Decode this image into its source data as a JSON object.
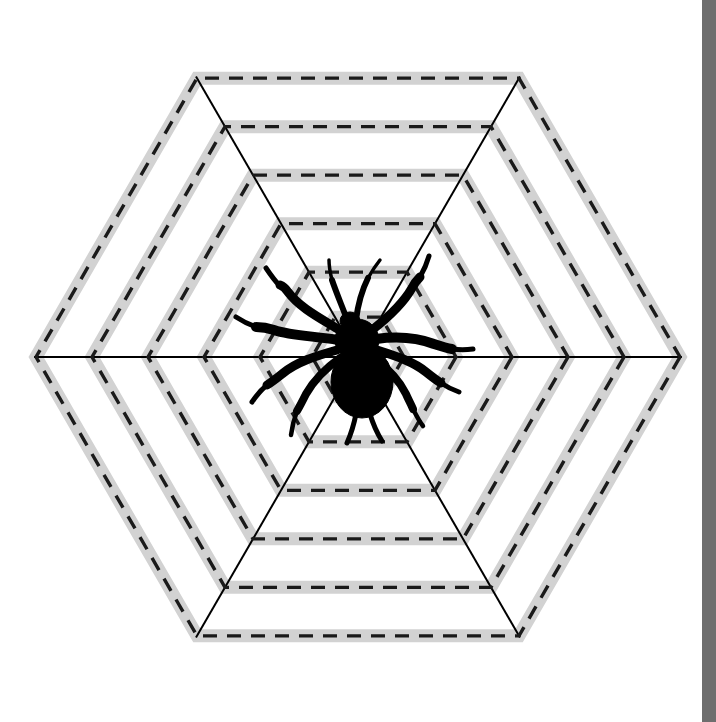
{
  "page": {
    "background_color": "#ffffff",
    "width": 716,
    "height": 722
  },
  "scrollbar": {
    "name": "vertical-scrollbar",
    "track_color": "#6e6e6e",
    "thumb_color": "#6e6e6e",
    "x": 702,
    "width": 14
  },
  "chart_data": {
    "type": "diagram",
    "subtitle": "",
    "xlabel": "",
    "ylabel": "",
    "center": {
      "x": 358,
      "y": 357
    },
    "orientation": "pointy-left-right",
    "grid": true,
    "legend": "none",
    "annotations": [],
    "band": {
      "fill_color": "#d2d2d2",
      "band_width": 13,
      "dash_color": "#1a1a1a",
      "dash_width": 3.4,
      "dash_pattern": "14 10"
    },
    "spokes": {
      "count": 3,
      "angles_deg": [
        0,
        60,
        120
      ],
      "color": "#000000",
      "width": 2,
      "length": 324,
      "horizontal_extent": {
        "x1": 34,
        "x2": 682,
        "y": 357
      }
    },
    "rings": [
      {
        "index": 1,
        "label": "ring-1-outer",
        "radius": 322
      },
      {
        "index": 2,
        "label": "ring-2",
        "radius": 266
      },
      {
        "index": 3,
        "label": "ring-3",
        "radius": 210
      },
      {
        "index": 4,
        "label": "ring-4",
        "radius": 154
      },
      {
        "index": 5,
        "label": "ring-5",
        "radius": 98
      },
      {
        "index": 6,
        "label": "ring-6-inner",
        "radius": 46
      }
    ],
    "spider": {
      "label": "spider-silhouette",
      "color": "#000000",
      "center": {
        "x": 362,
        "y": 360
      },
      "body_length": 80,
      "leg_count": 8
    }
  }
}
